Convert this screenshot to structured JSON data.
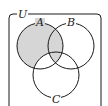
{
  "diagram": {
    "type": "venn",
    "universe_label": "U",
    "sets": [
      {
        "name": "A",
        "label": "A"
      },
      {
        "name": "B",
        "label": "B"
      },
      {
        "name": "C",
        "label": "C"
      }
    ],
    "shaded_region": "A minus (A∩C outside B)",
    "colors": {
      "stroke": "#1a1a1a",
      "shade": "#d6d6d6",
      "background": "#ffffff"
    }
  }
}
